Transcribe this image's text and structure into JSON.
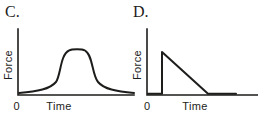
{
  "figure": {
    "background": "#ffffff",
    "line_color": "#1d1d1b",
    "text_color": "#1d1d1b",
    "panels": [
      {
        "label": "C.",
        "ylabel": "Force",
        "xlabel": "Time",
        "origin_tick": "0",
        "axis_path": "M18 29 L18 95 L134 95",
        "curve_path": "M19 93 C38 91.5 50 89 56 82 C61 75 60 55 69 50.5 C72 48.8 82 48.8 85 50.5 C93 55 92 75 98 82 C104 89 116 91.5 134 93"
      },
      {
        "label": "D.",
        "ylabel": "Force",
        "xlabel": "Time",
        "origin_tick": "0",
        "axis_path": "M147 29 L147 95 L257.5 95",
        "curve_path": "M148 93.8 L162 93.8 L162 52 L208 93.8 L236 93.8"
      }
    ]
  },
  "chart_data": [
    {
      "type": "line",
      "title": "C.",
      "xlabel": "Time",
      "ylabel": "Force",
      "x_tick_labels": [
        "0"
      ],
      "y_tick_labels": [],
      "grid": false,
      "legend": false,
      "x": [
        0,
        1,
        2,
        3,
        3.6,
        4.2,
        4.8,
        5.4,
        6,
        6.6,
        7.2,
        8,
        9,
        10
      ],
      "y": [
        0,
        0.02,
        0.06,
        0.15,
        0.45,
        0.85,
        1.0,
        1.0,
        0.85,
        0.45,
        0.15,
        0.06,
        0.02,
        0
      ],
      "description": "Force rises gradually from zero, surges to a rounded plateau peak, then falls symmetrically back to zero over time"
    },
    {
      "type": "line",
      "title": "D.",
      "xlabel": "Time",
      "ylabel": "Force",
      "x_tick_labels": [
        "0"
      ],
      "y_tick_labels": [],
      "grid": false,
      "legend": false,
      "x": [
        0,
        1.3,
        1.3,
        5.5,
        8
      ],
      "y": [
        0,
        0,
        1.0,
        0,
        0
      ],
      "description": "Force is zero, jumps instantaneously to its peak, decays linearly back to zero, then remains at zero"
    }
  ]
}
